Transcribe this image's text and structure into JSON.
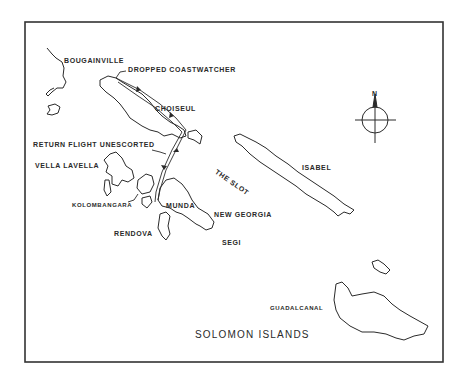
{
  "map": {
    "title": "SOLOMON ISLANDS",
    "compass": {
      "north_label": "N"
    },
    "labels": {
      "bougainville": "BOUGAINVILLE",
      "dropped_coastwatcher": "DROPPED COASTWATCHER",
      "choiseul": "CHOISEUL",
      "return_flight": "RETURN FLIGHT UNESCORTED",
      "vella_lavella": "VELLA LAVELLA",
      "kolombangara": "KOLOMBANGARA",
      "munda": "MUNDA",
      "new_georgia": "NEW GEORGIA",
      "rendova": "RENDOVA",
      "segi": "SEGI",
      "the_slot": "THE SLOT",
      "isabel": "ISABEL",
      "guadalcanal": "GUADALCANAL"
    },
    "colors": {
      "ink": "#2a2a2a",
      "background": "#ffffff"
    }
  }
}
